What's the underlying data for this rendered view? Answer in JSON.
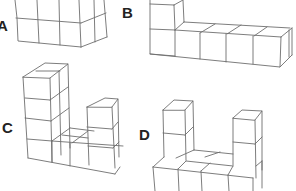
{
  "figures": [
    {
      "id": "A",
      "label": "A",
      "label_pos": [
        -3,
        18
      ],
      "description": "block of cubes, 2 rows visible, 3 columns front plus right side column"
    },
    {
      "id": "B",
      "label": "B",
      "label_pos": [
        122,
        5
      ],
      "description": "L-shape: 4-long row with a 2-high column at the left end"
    },
    {
      "id": "C",
      "label": "C",
      "label_pos": [
        2,
        120
      ],
      "description": "U-shape: left column 4 high, right column 2 high, 4-wide base"
    },
    {
      "id": "D",
      "label": "D",
      "label_pos": [
        139,
        127
      ],
      "description": "U-shape: left column 3 high, right column 3 high, 4-wide base"
    }
  ],
  "colors": {
    "stroke": "#6e6e6e",
    "label": "#222222",
    "background": "#ffffff"
  }
}
